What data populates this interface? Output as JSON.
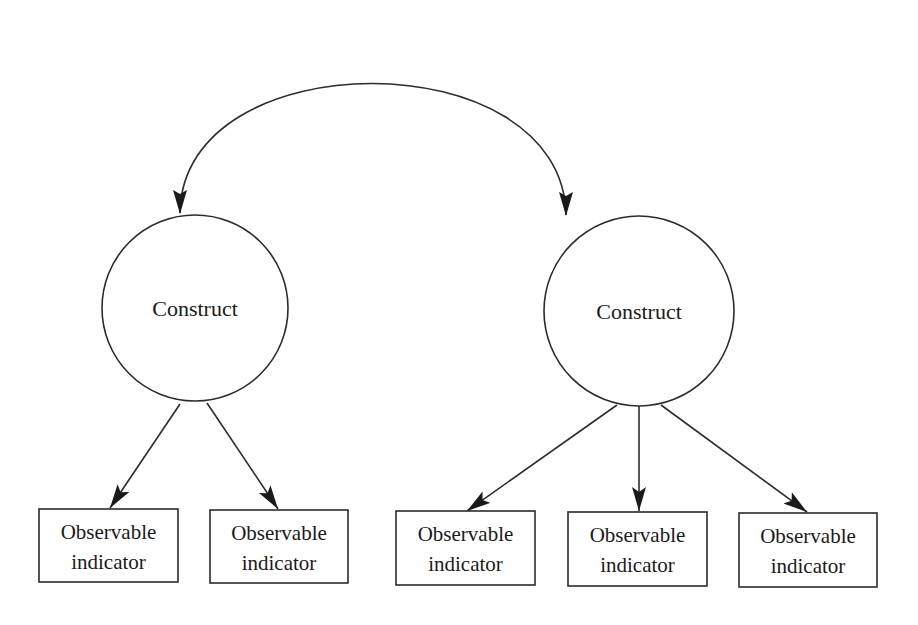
{
  "diagram": {
    "type": "structural-equation-model",
    "stroke_color": "#2b2b2b",
    "background": "#ffffff",
    "correlation": {
      "label": "",
      "from": "construct_1",
      "to": "construct_2",
      "bidirectional": true
    },
    "constructs": [
      {
        "id": "construct_1",
        "label": "Construct",
        "cx": 195,
        "cy": 308,
        "r": 93
      },
      {
        "id": "construct_2",
        "label": "Construct",
        "cx": 639,
        "cy": 311,
        "r": 95
      }
    ],
    "indicators": [
      {
        "id": "ind_1",
        "line1": "Observable",
        "line2": "indicator",
        "x": 39,
        "y": 509,
        "w": 139,
        "h": 73,
        "parent": "construct_1"
      },
      {
        "id": "ind_2",
        "line1": "Observable",
        "line2": "indicator",
        "x": 210,
        "y": 510,
        "w": 138,
        "h": 73,
        "parent": "construct_1"
      },
      {
        "id": "ind_3",
        "line1": "Observable",
        "line2": "indicator",
        "x": 396,
        "y": 511,
        "w": 139,
        "h": 74,
        "parent": "construct_2"
      },
      {
        "id": "ind_4",
        "line1": "Observable",
        "line2": "indicator",
        "x": 568,
        "y": 512,
        "w": 139,
        "h": 74,
        "parent": "construct_2"
      },
      {
        "id": "ind_5",
        "line1": "Observable",
        "line2": "indicator",
        "x": 739,
        "y": 513,
        "w": 138,
        "h": 74,
        "parent": "construct_2"
      }
    ]
  }
}
